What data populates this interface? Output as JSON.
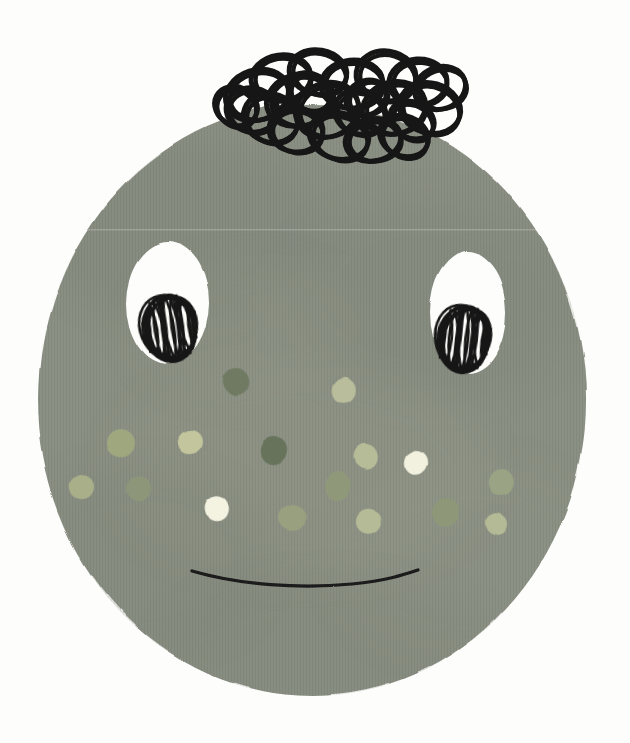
{
  "artwork": {
    "title": "Illustrated Face with Scribble Hair",
    "subject": "character-portrait",
    "medium": "mixed-media collage with ink pen drawing",
    "canvas": {
      "width": 630,
      "height": 743
    }
  },
  "palette": {
    "background": "#fdfdfb",
    "face_fill": "#8b9084",
    "face_fill_shade_a": "#848a7d",
    "face_fill_shade_b": "#939889",
    "face_fill_shade_c": "#7e8478",
    "eye_white": "#fdfdfb",
    "ink_black": "#141414",
    "mouth_black": "#1a1a1a"
  },
  "head": {
    "label": "head",
    "cx": 312,
    "cy": 400,
    "rx": 274,
    "ry": 296,
    "top": 104,
    "bottom": 696,
    "left": 38,
    "right": 586,
    "fill": "#8b9084"
  },
  "hair": {
    "label": "scribbled loop hair",
    "stroke": "#141414",
    "stroke_width": 5,
    "loop_count": 22,
    "bounds": {
      "x": 222,
      "y": 42,
      "width": 245,
      "height": 128
    },
    "loops": [
      {
        "cx": 257,
        "cy": 95,
        "rx": 32,
        "ry": 25,
        "rot": -18
      },
      {
        "cx": 252,
        "cy": 110,
        "rx": 26,
        "ry": 22,
        "rot": 12
      },
      {
        "cx": 281,
        "cy": 78,
        "rx": 30,
        "ry": 23,
        "rot": -8
      },
      {
        "cx": 271,
        "cy": 118,
        "rx": 28,
        "ry": 24,
        "rot": 20
      },
      {
        "cx": 300,
        "cy": 100,
        "rx": 34,
        "ry": 26,
        "rot": -14
      },
      {
        "cx": 296,
        "cy": 130,
        "rx": 27,
        "ry": 22,
        "rot": 6
      },
      {
        "cx": 318,
        "cy": 72,
        "rx": 29,
        "ry": 22,
        "rot": 10
      },
      {
        "cx": 327,
        "cy": 110,
        "rx": 32,
        "ry": 27,
        "rot": -22
      },
      {
        "cx": 339,
        "cy": 136,
        "rx": 30,
        "ry": 23,
        "rot": 14
      },
      {
        "cx": 352,
        "cy": 84,
        "rx": 31,
        "ry": 24,
        "rot": -6
      },
      {
        "cx": 360,
        "cy": 112,
        "rx": 26,
        "ry": 22,
        "rot": 18
      },
      {
        "cx": 373,
        "cy": 140,
        "rx": 28,
        "ry": 21,
        "rot": -12
      },
      {
        "cx": 386,
        "cy": 76,
        "rx": 30,
        "ry": 25,
        "rot": 8
      },
      {
        "cx": 394,
        "cy": 108,
        "rx": 32,
        "ry": 26,
        "rot": -16
      },
      {
        "cx": 404,
        "cy": 136,
        "rx": 25,
        "ry": 20,
        "rot": 22
      },
      {
        "cx": 418,
        "cy": 82,
        "rx": 29,
        "ry": 23,
        "rot": -4
      },
      {
        "cx": 430,
        "cy": 108,
        "rx": 31,
        "ry": 25,
        "rot": 16
      },
      {
        "cx": 440,
        "cy": 88,
        "rx": 26,
        "ry": 21,
        "rot": -20
      },
      {
        "cx": 236,
        "cy": 106,
        "rx": 22,
        "ry": 19,
        "rot": 28
      },
      {
        "cx": 310,
        "cy": 92,
        "rx": 22,
        "ry": 18,
        "rot": 34
      },
      {
        "cx": 366,
        "cy": 98,
        "rx": 21,
        "ry": 17,
        "rot": -30
      },
      {
        "cx": 412,
        "cy": 120,
        "rx": 23,
        "ry": 18,
        "rot": 26
      }
    ]
  },
  "eyes": [
    {
      "label": "left-eye",
      "white": {
        "cx": 168,
        "cy": 303,
        "rx": 41,
        "ry": 61,
        "fill": "#fdfdfb"
      },
      "pupil": {
        "cx": 170,
        "cy": 328,
        "rx": 27,
        "ry": 33,
        "rot": -8,
        "scribble_strokes": 26,
        "stroke": "#141414"
      }
    },
    {
      "label": "right-eye",
      "white": {
        "cx": 468,
        "cy": 313,
        "rx": 38,
        "ry": 61,
        "fill": "#fdfdfb"
      },
      "pupil": {
        "cx": 464,
        "cy": 339,
        "rx": 26,
        "ry": 33,
        "rot": 6,
        "scribble_strokes": 26,
        "stroke": "#141414"
      }
    }
  ],
  "mouth": {
    "label": "mouth",
    "path": "M 192 571 C 240 585, 300 589, 352 584 C 390 580, 406 574, 418 570",
    "stroke": "#1a1a1a",
    "stroke_width": 3.2
  },
  "freckles": [
    {
      "cx": 236,
      "cy": 381,
      "rx": 13,
      "ry": 14,
      "rot": -12,
      "fill": "#6f7a63"
    },
    {
      "cx": 345,
      "cy": 389,
      "rx": 12,
      "ry": 13,
      "rot": 8,
      "fill": "#b9bd9c"
    },
    {
      "cx": 120,
      "cy": 443,
      "rx": 14,
      "ry": 14,
      "rot": 14,
      "fill": "#9ea77e"
    },
    {
      "cx": 190,
      "cy": 443,
      "rx": 12,
      "ry": 12,
      "rot": -6,
      "fill": "#c3c69d"
    },
    {
      "cx": 273,
      "cy": 450,
      "rx": 13,
      "ry": 14,
      "rot": 10,
      "fill": "#68735c"
    },
    {
      "cx": 365,
      "cy": 458,
      "rx": 12,
      "ry": 13,
      "rot": -16,
      "fill": "#b7bc98"
    },
    {
      "cx": 501,
      "cy": 481,
      "rx": 13,
      "ry": 14,
      "rot": 6,
      "fill": "#9aa383"
    },
    {
      "cx": 82,
      "cy": 487,
      "rx": 12,
      "ry": 12,
      "rot": -10,
      "fill": "#a9b089"
    },
    {
      "cx": 138,
      "cy": 489,
      "rx": 13,
      "ry": 13,
      "rot": 16,
      "fill": "#8d9679"
    },
    {
      "cx": 337,
      "cy": 487,
      "rx": 13,
      "ry": 14,
      "rot": -8,
      "fill": "#8f9879"
    },
    {
      "cx": 416,
      "cy": 463,
      "rx": 12,
      "ry": 13,
      "rot": 12,
      "fill": "#f2f0de"
    },
    {
      "cx": 218,
      "cy": 509,
      "rx": 12,
      "ry": 13,
      "rot": -14,
      "fill": "#f4f2e1"
    },
    {
      "cx": 292,
      "cy": 517,
      "rx": 14,
      "ry": 13,
      "rot": 8,
      "fill": "#98a07f"
    },
    {
      "cx": 446,
      "cy": 512,
      "rx": 14,
      "ry": 14,
      "rot": -6,
      "fill": "#8e9778"
    },
    {
      "cx": 369,
      "cy": 522,
      "rx": 12,
      "ry": 12,
      "rot": 18,
      "fill": "#b6bb97"
    },
    {
      "cx": 497,
      "cy": 524,
      "rx": 11,
      "ry": 11,
      "rot": -12,
      "fill": "#b4ba95"
    }
  ],
  "texture": {
    "label": "paper-grain",
    "vertical_stripe_opacity": 0.055,
    "blotch_count": 7
  }
}
